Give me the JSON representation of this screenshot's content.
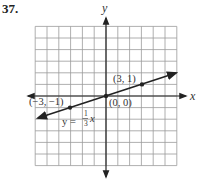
{
  "problem_number": "37.",
  "axes": {
    "x_label": "x",
    "y_label": "y"
  },
  "grid": {
    "x_min": -6,
    "x_max": 6,
    "y_min": -6,
    "y_max": 6,
    "step": 1
  },
  "line": {
    "equation_prefix": "y =",
    "equation_num": "1",
    "equation_den": "3",
    "equation_var": "x",
    "slope": 0.3333,
    "intercept": 0
  },
  "points": [
    {
      "x": -3,
      "y": -1,
      "label": "(−3, −1)"
    },
    {
      "x": 0,
      "y": 0,
      "label": "(0, 0)"
    },
    {
      "x": 3,
      "y": 1,
      "label": "(3, 1)"
    }
  ],
  "chart_data": {
    "type": "line",
    "title": "37.",
    "xlabel": "x",
    "ylabel": "y",
    "xlim": [
      -6,
      6
    ],
    "ylim": [
      -6,
      6
    ],
    "grid": true,
    "series": [
      {
        "name": "y = (1/3)x",
        "x": [
          -6,
          -3,
          0,
          3,
          6
        ],
        "y": [
          -2,
          -1,
          0,
          1,
          2
        ]
      }
    ],
    "annotations": [
      "(−3, −1)",
      "(0, 0)",
      "(3, 1)",
      "y = 1/3 x"
    ]
  }
}
